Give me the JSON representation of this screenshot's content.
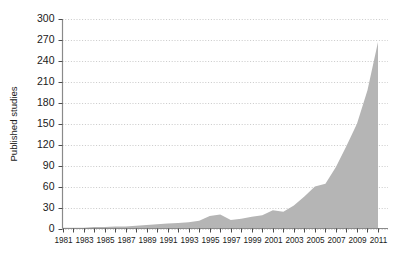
{
  "chart_data": {
    "type": "area",
    "title": "",
    "xlabel": "",
    "ylabel": "Published studies",
    "xlim": [
      1981,
      2011
    ],
    "ylim": [
      0,
      300
    ],
    "yticks": [
      0,
      30,
      60,
      90,
      120,
      150,
      180,
      210,
      240,
      270,
      300
    ],
    "ytick_labels": [
      "0",
      "30",
      "60",
      "90",
      "120",
      "150",
      "180",
      "210",
      "240",
      "270",
      "300"
    ],
    "xticks": [
      1981,
      1982,
      1983,
      1984,
      1985,
      1986,
      1987,
      1988,
      1989,
      1990,
      1991,
      1992,
      1993,
      1994,
      1995,
      1996,
      1997,
      1998,
      1999,
      2000,
      2001,
      2002,
      2003,
      2004,
      2005,
      2006,
      2007,
      2008,
      2009,
      2010,
      2011
    ],
    "xtick_labels": [
      "1981",
      "",
      "1983",
      "",
      "1985",
      "",
      "1987",
      "",
      "1989",
      "",
      "1991",
      "",
      "1993",
      "",
      "1995",
      "",
      "1997",
      "",
      "1999",
      "",
      "2001",
      "",
      "2003",
      "",
      "2005",
      "",
      "2007",
      "",
      "2009",
      "",
      "2011"
    ],
    "grid": true,
    "grid_axis": "y",
    "legend": "none",
    "x": [
      1981,
      1982,
      1983,
      1984,
      1985,
      1986,
      1987,
      1988,
      1989,
      1990,
      1991,
      1992,
      1993,
      1994,
      1995,
      1996,
      1997,
      1998,
      1999,
      2000,
      2001,
      2002,
      2003,
      2004,
      2005,
      2006,
      2007,
      2008,
      2009,
      2010,
      2011
    ],
    "values": [
      1,
      1,
      1,
      2,
      2,
      3,
      3,
      4,
      5,
      6,
      7,
      8,
      9,
      11,
      18,
      20,
      12,
      14,
      17,
      19,
      26,
      24,
      33,
      46,
      60,
      64,
      88,
      118,
      150,
      198,
      267
    ],
    "series": [
      {
        "name": "Published studies",
        "values": [
          1,
          1,
          1,
          2,
          2,
          3,
          3,
          4,
          5,
          6,
          7,
          8,
          9,
          11,
          18,
          20,
          12,
          14,
          17,
          19,
          26,
          24,
          33,
          46,
          60,
          64,
          88,
          118,
          150,
          198,
          267
        ]
      }
    ],
    "colors": {
      "area_fill": "#b5b5b5",
      "gridline": "#c9c9c9",
      "axis_line": "#808080",
      "text": "#1a1a1a",
      "background": "#ffffff"
    }
  }
}
